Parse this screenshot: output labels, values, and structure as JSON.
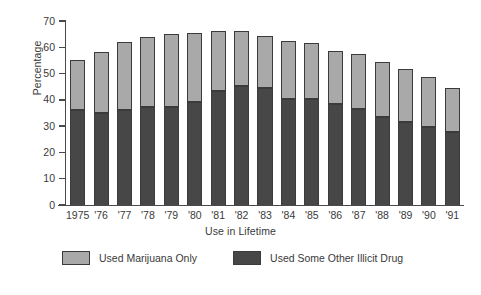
{
  "chart_data": {
    "type": "bar",
    "subtype": "stacked-vertical",
    "title": "",
    "xlabel": "Use in Lifetime",
    "ylabel": "Percentage",
    "categories": [
      "1975",
      "'76",
      "'77",
      "'78",
      "'79",
      "'80",
      "'81",
      "'82",
      "'83",
      "'84",
      "'85",
      "'86",
      "'87",
      "'88",
      "'89",
      "'90",
      "'91"
    ],
    "ylim": [
      0,
      70
    ],
    "yticks": [
      0,
      10,
      20,
      30,
      40,
      50,
      60,
      70
    ],
    "ytick_labels": [
      "0",
      "10",
      "20",
      "30",
      "40",
      "50",
      "60",
      "70"
    ],
    "grid": false,
    "legend_position": "bottom",
    "series": [
      {
        "name": "Used Some Other Illicit Drug",
        "color": "#474747",
        "stack_order": "bottom",
        "values": [
          36.0,
          35.1,
          36.2,
          37.2,
          37.2,
          39.2,
          43.2,
          45.3,
          44.4,
          40.4,
          40.5,
          38.5,
          36.7,
          33.5,
          31.5,
          29.5,
          27.6
        ]
      },
      {
        "name": "Used Marijuana Only",
        "color": "#a9a9a9",
        "stack_order": "top",
        "values": [
          19.0,
          23.0,
          25.8,
          26.8,
          27.8,
          26.1,
          23.0,
          20.9,
          20.0,
          22.1,
          21.0,
          20.0,
          20.8,
          21.0,
          20.3,
          19.3,
          17.1
        ]
      }
    ],
    "totals": [
      55.0,
      58.1,
      62.0,
      64.0,
      65.0,
      65.3,
      66.2,
      66.2,
      64.4,
      62.5,
      61.5,
      58.5,
      57.5,
      54.5,
      51.8,
      48.8,
      44.7
    ]
  },
  "legend": {
    "entries": [
      {
        "label": "Used Marijuana Only",
        "color": "#a9a9a9"
      },
      {
        "label": "Used Some Other Illicit Drug",
        "color": "#474747"
      }
    ]
  }
}
